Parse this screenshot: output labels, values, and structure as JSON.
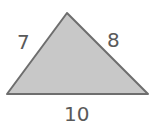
{
  "diagram": {
    "type": "triangle",
    "fill_color": "#c8c8c8",
    "stroke_color": "#6e6e6e",
    "vertices": {
      "apex": [
        67,
        13
      ],
      "bottom_left": [
        7,
        94
      ],
      "bottom_right": [
        148,
        94
      ]
    },
    "side_labels": {
      "left": "7",
      "right": "8",
      "bottom": "10"
    }
  }
}
